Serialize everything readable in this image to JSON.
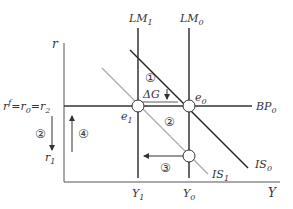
{
  "diagram": {
    "axes": {
      "y_label": "r",
      "x_label": "Y"
    },
    "rate_labels": {
      "equal_rates": {
        "base": "r",
        "sup": "f",
        "mid1": "=r",
        "mid1_sub": "0",
        "mid2": "=r",
        "mid2_sub": "2"
      },
      "r1": {
        "base": "r",
        "sub": "1"
      }
    },
    "income_labels": {
      "y1": {
        "base": "Y",
        "sub": "1"
      },
      "y0": {
        "base": "Y",
        "sub": "0"
      }
    },
    "curves": {
      "lm1": {
        "base": "LM",
        "sub": "1",
        "color": "#333333"
      },
      "lm0": {
        "base": "LM",
        "sub": "0",
        "color": "#333333"
      },
      "bp0": {
        "base": "BP",
        "sub": "0",
        "color": "#333333"
      },
      "is0": {
        "base": "IS",
        "sub": "0",
        "color": "#222222"
      },
      "is1": {
        "base": "IS",
        "sub": "1",
        "color": "#aaaaaa"
      }
    },
    "points": {
      "e0": {
        "base": "e",
        "sub": "0"
      },
      "e1": {
        "base": "e",
        "sub": "1"
      }
    },
    "steps": {
      "step1": "①",
      "step2_axis": "②",
      "step2_curve": "②",
      "step3": "③",
      "step4": "④"
    },
    "annotations": {
      "delta_g": "ΔG",
      "delta_g_arrow": "↓"
    }
  }
}
